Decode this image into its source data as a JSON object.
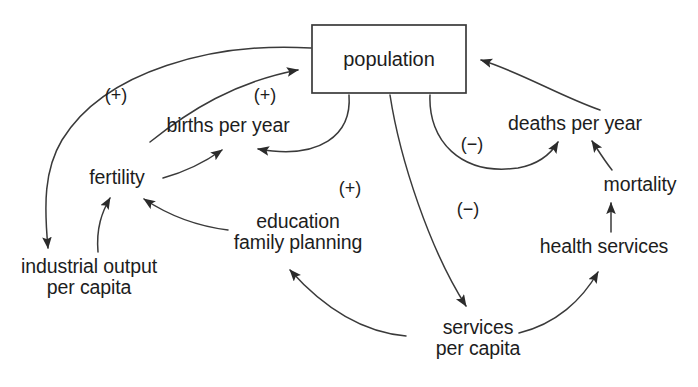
{
  "diagram": {
    "type": "causal-loop-diagram",
    "background_color": "#ffffff",
    "line_color": "#3a3a3a",
    "text_color": "#1d1d1d",
    "nodes": [
      {
        "id": "population",
        "label": "population",
        "boxed": true,
        "x": 389,
        "y": 59,
        "w": 154,
        "h": 68
      },
      {
        "id": "births",
        "label": "births per year",
        "boxed": false,
        "x": 228,
        "y": 125
      },
      {
        "id": "deaths",
        "label": "deaths per year",
        "boxed": false,
        "x": 575,
        "y": 123
      },
      {
        "id": "fertility",
        "label": "fertility",
        "boxed": false,
        "x": 117,
        "y": 177
      },
      {
        "id": "mortality",
        "label": "mortality",
        "boxed": false,
        "x": 640,
        "y": 184
      },
      {
        "id": "education",
        "label": "education\nfamily planning",
        "boxed": false,
        "x": 298,
        "y": 232
      },
      {
        "id": "health_services",
        "label": "health services",
        "boxed": false,
        "x": 604,
        "y": 246
      },
      {
        "id": "industrial_output",
        "label": "industrial output\nper capita",
        "boxed": false,
        "x": 89,
        "y": 277
      },
      {
        "id": "services",
        "label": "services\nper capita",
        "boxed": false,
        "x": 478,
        "y": 338
      }
    ],
    "polarity_labels": [
      {
        "id": "plus-births-population",
        "text": "(+)",
        "x": 116,
        "y": 95
      },
      {
        "id": "plus-population-births",
        "text": "(+)",
        "x": 265,
        "y": 95
      },
      {
        "id": "plus-education-fertility",
        "text": "(+)",
        "x": 350,
        "y": 188
      },
      {
        "id": "minus-population-deaths",
        "text": "(−)",
        "x": 472,
        "y": 144
      },
      {
        "id": "minus-population-services",
        "text": "(−)",
        "x": 468,
        "y": 209
      }
    ],
    "edges": [
      {
        "id": "births-to-population",
        "from": "births",
        "to": "population",
        "polarity": "+"
      },
      {
        "id": "population-to-births",
        "from": "population",
        "to": "births",
        "polarity": "+"
      },
      {
        "id": "fertility-to-births",
        "from": "fertility",
        "to": "births",
        "polarity": ""
      },
      {
        "id": "population-to-industrial-output",
        "from": "population",
        "to": "industrial_output",
        "polarity": "+"
      },
      {
        "id": "industrial-output-to-fertility",
        "from": "industrial_output",
        "to": "fertility",
        "polarity": ""
      },
      {
        "id": "education-to-fertility",
        "from": "education",
        "to": "fertility",
        "polarity": "+"
      },
      {
        "id": "services-to-education",
        "from": "services",
        "to": "education",
        "polarity": ""
      },
      {
        "id": "population-to-services",
        "from": "population",
        "to": "services",
        "polarity": "−"
      },
      {
        "id": "services-to-health-services",
        "from": "services",
        "to": "health_services",
        "polarity": ""
      },
      {
        "id": "health-services-to-mortality",
        "from": "health_services",
        "to": "mortality",
        "polarity": ""
      },
      {
        "id": "mortality-to-deaths",
        "from": "mortality",
        "to": "deaths",
        "polarity": ""
      },
      {
        "id": "population-to-deaths",
        "from": "population",
        "to": "deaths",
        "polarity": "−"
      },
      {
        "id": "deaths-to-population",
        "from": "deaths",
        "to": "population",
        "polarity": ""
      }
    ]
  }
}
